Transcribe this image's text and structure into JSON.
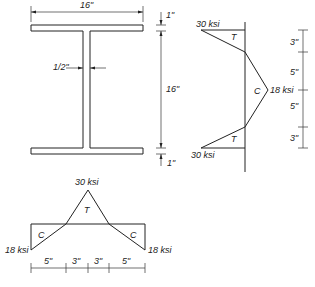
{
  "beam_section": {
    "flange_width": "16\"",
    "flange_thickness_top": "1\"",
    "web_height": "16\"",
    "flange_thickness_bottom": "1\"",
    "web_thickness": "1/2\""
  },
  "flange_stress": {
    "top_stress": "30 ksi",
    "bottom_stress": "30 ksi",
    "mid_stress": "18 ksi",
    "tension_label_top": "T",
    "tension_label_bottom": "T",
    "compression_label": "C",
    "dims": [
      "3\"",
      "5\"",
      "5\"",
      "3\""
    ]
  },
  "web_stress": {
    "peak_stress": "30 ksi",
    "left_stress": "18 ksi",
    "right_stress": "18 ksi",
    "tension_label": "T",
    "compression_left": "C",
    "compression_right": "C",
    "dims": [
      "5\"",
      "3\"",
      "3\"",
      "5\""
    ]
  }
}
